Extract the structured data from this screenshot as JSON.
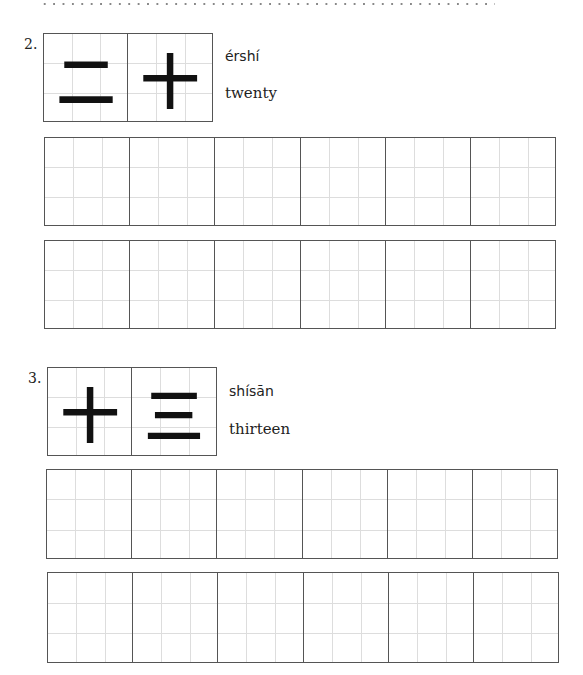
{
  "decor": {
    "dotted_rule": true
  },
  "items": [
    {
      "number": "2.",
      "characters": [
        "二",
        "十"
      ],
      "pinyin": "érshí",
      "meaning": "twenty",
      "practice_rows": 2,
      "cells_per_row": 6
    },
    {
      "number": "3.",
      "characters": [
        "十",
        "三"
      ],
      "pinyin": "shísān",
      "meaning": "thirteen",
      "practice_rows": 2,
      "cells_per_row": 6
    }
  ]
}
